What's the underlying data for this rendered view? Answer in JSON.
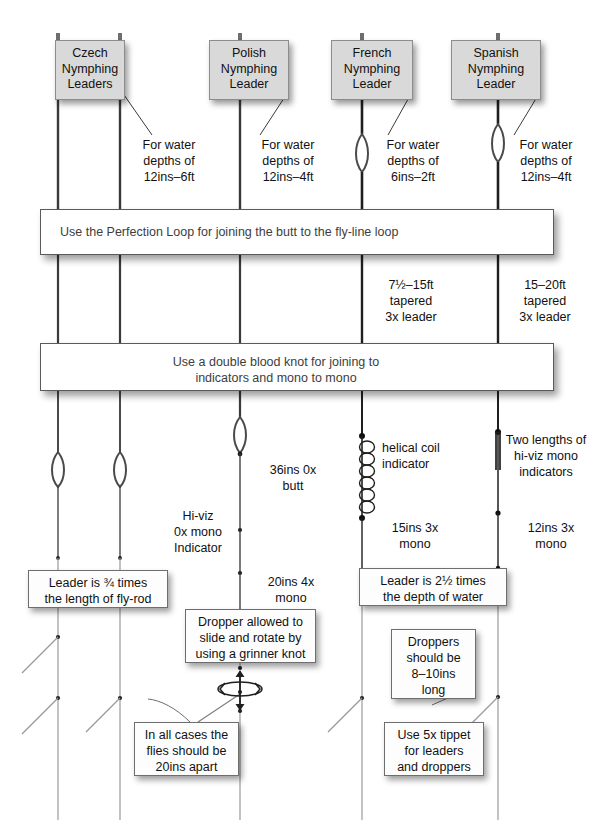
{
  "diagram": {
    "colors": {
      "header_box_fill": "#d9d9d9",
      "header_box_border": "#8c8c8c",
      "line_dark": "#2b2b2b",
      "line_grey": "#8f8f8f",
      "knot_grey": "#9a9a9a",
      "knot_dark": "#3b3b3b",
      "bar_text": "#3d3d3d",
      "background": "#ffffff"
    }
  },
  "headers": [
    {
      "id": "czech",
      "label": "Czech\nNymphing\nLeaders"
    },
    {
      "id": "polish",
      "label": "Polish\nNymphing\nLeader"
    },
    {
      "id": "french",
      "label": "French\nNymphing\nLeader"
    },
    {
      "id": "spanish",
      "label": "Spanish\nNymphing\nLeader"
    }
  ],
  "depth_notes": [
    {
      "id": "czech-depth",
      "text": "For water\ndepths of\n12ins–6ft"
    },
    {
      "id": "polish-depth",
      "text": "For water\ndepths of\n12ins–4ft"
    },
    {
      "id": "french-depth",
      "text": "For water\ndepths of\n6ins–2ft"
    },
    {
      "id": "spanish-depth",
      "text": "For water\ndepths of\n12ins–4ft"
    }
  ],
  "bars": [
    {
      "id": "perfection-loop-bar",
      "text": "Use the Perfection Loop for joining the butt to the fly-line loop",
      "knot": "perfection-loop-knot"
    },
    {
      "id": "blood-knot-bar",
      "text": "Use a double blood knot for joining to\nindicators and mono to mono",
      "knot": "double-blood-knot"
    }
  ],
  "leader_specs": [
    {
      "id": "french-leader-spec",
      "text": "7½–15ft\ntapered\n3x leader"
    },
    {
      "id": "spanish-leader-spec",
      "text": "15–20ft\ntapered\n3x leader"
    }
  ],
  "segment_notes": [
    {
      "id": "polish-butt",
      "text": "36ins  0x\nbutt"
    },
    {
      "id": "polish-hiviz-indicator",
      "text": "Hi-viz\n0x mono\nIndicator"
    },
    {
      "id": "polish-tippet",
      "text": "20ins  4x\nmono"
    },
    {
      "id": "french-helical-coil",
      "text": "helical coil\nindicator"
    },
    {
      "id": "french-mono",
      "text": "15ins  3x\nmono"
    },
    {
      "id": "spanish-indicators",
      "text": "Two lengths of\nhi-viz mono\nindicators"
    },
    {
      "id": "spanish-mono",
      "text": "12ins  3x\nmono"
    }
  ],
  "callouts": [
    {
      "id": "leader-length-rod",
      "text": "Leader is ¾ times\nthe length of fly-rod"
    },
    {
      "id": "leader-depth-water",
      "text": "Leader is 2½ times\nthe depth of water"
    },
    {
      "id": "dropper-grinner",
      "text": "Dropper allowed to\nslide and rotate by\nusing a grinner knot"
    },
    {
      "id": "flies-spacing",
      "text": "In all cases the\nflies should be\n20ins apart"
    },
    {
      "id": "dropper-length",
      "text": "Droppers\nshould be\n8–10ins\nlong"
    },
    {
      "id": "tippet-spec",
      "text": "Use 5x tippet\nfor leaders\nand droppers"
    }
  ],
  "icons": {
    "perfection_loop": "perfection-loop-icon",
    "double_blood_knot": "double-blood-knot-icon",
    "helical_coil": "helical-coil-icon",
    "rotation_arrows": "rotation-arrows-icon",
    "line_loop": "line-loop-icon"
  }
}
